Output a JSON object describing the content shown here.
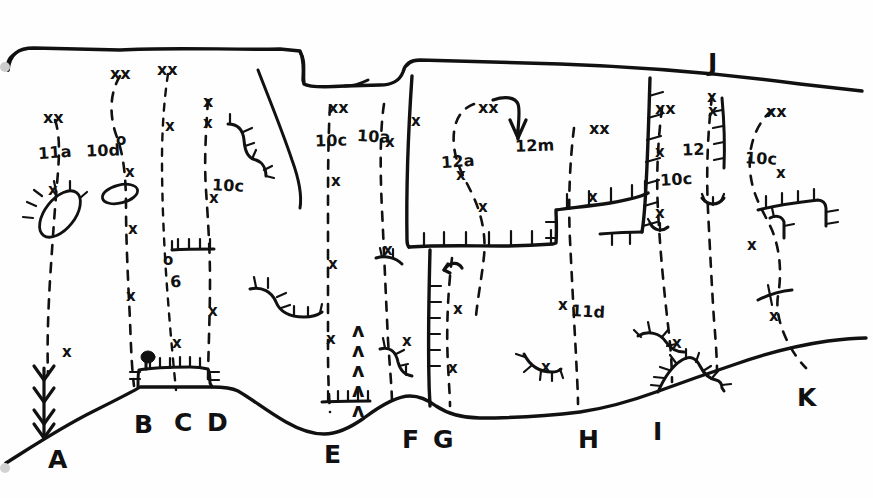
{
  "figure": {
    "kind": "hand-drawn-geologic-cross-section",
    "background_color": "#ffffff",
    "ink_color": "#111111",
    "width": 873,
    "height": 498
  },
  "unit_labels": [
    {
      "id": "u-11a",
      "text": "11a",
      "x": 38,
      "y": 143,
      "tilt": "tilt1"
    },
    {
      "id": "u-10d",
      "text": "10d",
      "x": 86,
      "y": 141,
      "tilt": "tilt3"
    },
    {
      "id": "u-10c-left",
      "text": "10c",
      "x": 212,
      "y": 176,
      "tilt": "tilt2"
    },
    {
      "id": "u-6",
      "text": "6",
      "x": 170,
      "y": 272,
      "tilt": "tilt1"
    },
    {
      "id": "u-10c-mid",
      "text": "10c",
      "x": 315,
      "y": 131,
      "tilt": "tilt3"
    },
    {
      "id": "u-10a",
      "text": "10a",
      "x": 357,
      "y": 127,
      "tilt": "tilt2"
    },
    {
      "id": "u-12a",
      "text": "12a",
      "x": 441,
      "y": 152,
      "tilt": "tilt1"
    },
    {
      "id": "u-12m",
      "text": "12m",
      "x": 515,
      "y": 136,
      "tilt": "tilt3"
    },
    {
      "id": "u-11d",
      "text": "11d",
      "x": 571,
      "y": 302,
      "tilt": "tilt2"
    },
    {
      "id": "u-10c-r1",
      "text": "10c",
      "x": 660,
      "y": 170,
      "tilt": "tilt1"
    },
    {
      "id": "u-12",
      "text": "12",
      "x": 682,
      "y": 140,
      "tilt": "tilt3"
    },
    {
      "id": "u-10c-r2",
      "text": "10c",
      "x": 745,
      "y": 149,
      "tilt": "tilt2"
    }
  ],
  "point_labels": [
    {
      "id": "p-A",
      "text": "A",
      "x": 48,
      "y": 445
    },
    {
      "id": "p-B",
      "text": "B",
      "x": 134,
      "y": 410
    },
    {
      "id": "p-C",
      "text": "C",
      "x": 174,
      "y": 408
    },
    {
      "id": "p-D",
      "text": "D",
      "x": 207,
      "y": 408
    },
    {
      "id": "p-E",
      "text": "E",
      "x": 324,
      "y": 440
    },
    {
      "id": "p-F",
      "text": "F",
      "x": 402,
      "y": 425
    },
    {
      "id": "p-G",
      "text": "G",
      "x": 433,
      "y": 425
    },
    {
      "id": "p-H",
      "text": "H",
      "x": 578,
      "y": 425
    },
    {
      "id": "p-I",
      "text": "I",
      "x": 653,
      "y": 417
    },
    {
      "id": "p-J",
      "text": "J",
      "x": 708,
      "y": 48
    },
    {
      "id": "p-K",
      "text": "K",
      "x": 797,
      "y": 383
    }
  ],
  "x_marks": [
    {
      "x": 43,
      "y": 110,
      "text": "xx",
      "size": "big"
    },
    {
      "x": 110,
      "y": 66,
      "text": "xx",
      "size": "big"
    },
    {
      "x": 157,
      "y": 62,
      "text": "xx",
      "size": "big"
    },
    {
      "x": 203,
      "y": 94,
      "text": "x",
      "size": "big"
    },
    {
      "x": 203,
      "y": 116,
      "text": "x",
      "size": ""
    },
    {
      "x": 48,
      "y": 183,
      "text": "x",
      "size": ""
    },
    {
      "x": 125,
      "y": 165,
      "text": "x",
      "size": ""
    },
    {
      "x": 128,
      "y": 222,
      "text": "x",
      "size": ""
    },
    {
      "x": 126,
      "y": 289,
      "text": "x",
      "size": ""
    },
    {
      "x": 62,
      "y": 345,
      "text": "x",
      "size": ""
    },
    {
      "x": 165,
      "y": 119,
      "text": "x",
      "size": ""
    },
    {
      "x": 163,
      "y": 253,
      "text": "o",
      "size": ""
    },
    {
      "x": 116,
      "y": 133,
      "text": "o",
      "size": ""
    },
    {
      "x": 209,
      "y": 191,
      "text": "x",
      "size": ""
    },
    {
      "x": 208,
      "y": 304,
      "text": "x",
      "size": ""
    },
    {
      "x": 172,
      "y": 336,
      "text": "x",
      "size": ""
    },
    {
      "x": 328,
      "y": 100,
      "text": "xx",
      "size": "big"
    },
    {
      "x": 331,
      "y": 174,
      "text": "x",
      "size": ""
    },
    {
      "x": 328,
      "y": 257,
      "text": "x",
      "size": ""
    },
    {
      "x": 326,
      "y": 332,
      "text": "x",
      "size": ""
    },
    {
      "x": 385,
      "y": 135,
      "text": "x",
      "size": ""
    },
    {
      "x": 383,
      "y": 243,
      "text": "x",
      "size": ""
    },
    {
      "x": 411,
      "y": 114,
      "text": "x",
      "size": ""
    },
    {
      "x": 402,
      "y": 334,
      "text": "x",
      "size": ""
    },
    {
      "x": 453,
      "y": 302,
      "text": "x",
      "size": ""
    },
    {
      "x": 448,
      "y": 361,
      "text": "x",
      "size": ""
    },
    {
      "x": 478,
      "y": 100,
      "text": "xx",
      "size": "big"
    },
    {
      "x": 478,
      "y": 200,
      "text": "x",
      "size": ""
    },
    {
      "x": 456,
      "y": 168,
      "text": "x",
      "size": ""
    },
    {
      "x": 541,
      "y": 360,
      "text": "x",
      "size": ""
    },
    {
      "x": 558,
      "y": 298,
      "text": "x",
      "size": ""
    },
    {
      "x": 589,
      "y": 121,
      "text": "xx",
      "size": "big"
    },
    {
      "x": 588,
      "y": 190,
      "text": "x",
      "size": ""
    },
    {
      "x": 655,
      "y": 101,
      "text": "xx",
      "size": "big"
    },
    {
      "x": 655,
      "y": 145,
      "text": "x",
      "size": ""
    },
    {
      "x": 655,
      "y": 206,
      "text": "x",
      "size": ""
    },
    {
      "x": 672,
      "y": 336,
      "text": "x",
      "size": ""
    },
    {
      "x": 707,
      "y": 90,
      "text": "x",
      "size": ""
    },
    {
      "x": 708,
      "y": 104,
      "text": "x",
      "size": ""
    },
    {
      "x": 766,
      "y": 104,
      "text": "xx",
      "size": "big"
    },
    {
      "x": 776,
      "y": 166,
      "text": "x",
      "size": ""
    },
    {
      "x": 747,
      "y": 238,
      "text": "x",
      "size": ""
    },
    {
      "x": 769,
      "y": 309,
      "text": "x",
      "size": ""
    }
  ],
  "caret_marks": [
    {
      "x": 352,
      "y": 321
    },
    {
      "x": 352,
      "y": 341
    },
    {
      "x": 352,
      "y": 361
    },
    {
      "x": 352,
      "y": 381
    },
    {
      "x": 352,
      "y": 401
    }
  ],
  "annotations": {
    "arrow_12m": "downward curved arrow to 12m",
    "closed_depression_left": "hachured closed ellipse near 11a",
    "plain_ellipse": "open ellipse near 10d"
  }
}
